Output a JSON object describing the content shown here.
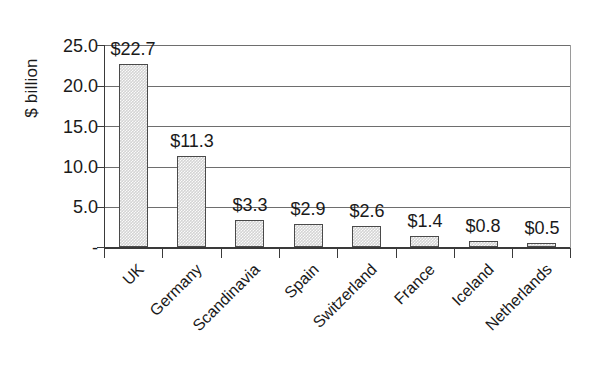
{
  "chart_data": {
    "type": "bar",
    "title": "",
    "subtitle": "",
    "xlabel": "",
    "ylabel": "$ billion",
    "categories": [
      "UK",
      "Germany",
      "Scandinavia",
      "Spain",
      "Switzerland",
      "France",
      "Iceland",
      "Netherlands"
    ],
    "values": [
      22.7,
      11.3,
      3.3,
      2.9,
      2.6,
      1.4,
      0.8,
      0.5
    ],
    "data_labels": [
      "$22.7",
      "$11.3",
      "$3.3",
      "$2.9",
      "$2.6",
      "$1.4",
      "$0.8",
      "$0.5"
    ],
    "ylim": [
      0,
      25
    ],
    "ytick_values": [
      0,
      5,
      10,
      15,
      20,
      25
    ],
    "ytick_labels": [
      "-",
      "5.0",
      "10.0",
      "15.0",
      "20.0",
      "25.0"
    ],
    "grid": true,
    "grid_axis": "y",
    "legend": false,
    "legend_position": "none",
    "bar_fill_color": "#d4d4d4",
    "bar_border_color": "#4a4a4a",
    "gridline_color": "#6e6e6e",
    "axis_color": "#3a3a3a",
    "background_color": "#ffffff",
    "text_color": "#1a1a1a",
    "category_label_rotation": -45
  }
}
